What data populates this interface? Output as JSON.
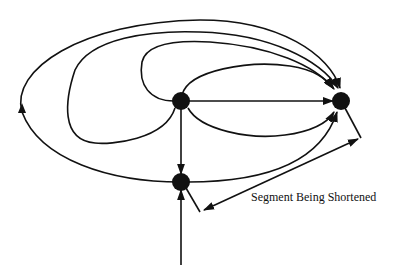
{
  "diagram": {
    "type": "graph",
    "nodes": [
      {
        "id": "A",
        "x": 181,
        "y": 101
      },
      {
        "id": "B",
        "x": 341,
        "y": 101
      },
      {
        "id": "C",
        "x": 181,
        "y": 182
      }
    ],
    "edges": [
      {
        "from": "A",
        "to": "B",
        "kind": "straight"
      },
      {
        "from": "A",
        "to": "C",
        "kind": "straight"
      },
      {
        "from": "A",
        "to": "B",
        "kind": "curve-upper-inner"
      },
      {
        "from": "A",
        "to": "B",
        "kind": "curve-upper-loop"
      },
      {
        "from": "A",
        "to": "B",
        "kind": "curve-lower"
      },
      {
        "from": "A",
        "to": "B",
        "kind": "curve-wide-loop"
      },
      {
        "from": "C",
        "to": "B",
        "kind": "curve-lower"
      },
      {
        "from": "C",
        "to": "B",
        "kind": "outer-loop"
      },
      {
        "from": "bottom",
        "to": "C",
        "kind": "straight"
      }
    ],
    "annotation": {
      "label": "Segment Being Shortened"
    }
  }
}
